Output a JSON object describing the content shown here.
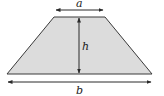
{
  "diagram": {
    "type": "trapezoid",
    "labels": {
      "top_base": "a",
      "height": "h",
      "bottom_base": "b"
    },
    "colors": {
      "fill": "#dcdcdc",
      "stroke": "#3a3a3a",
      "background": "#ffffff"
    }
  }
}
